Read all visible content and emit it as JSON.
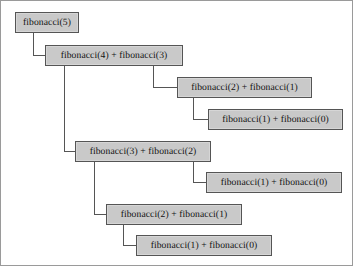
{
  "diagram": {
    "type": "recursion-tree",
    "canvas": {
      "width": 353,
      "height": 266,
      "background": "#ffffff",
      "border_color": "#9a9a9a"
    },
    "style": {
      "node_fill": "#c9c9c9",
      "node_border": "#555555",
      "node_text": "#121212",
      "connector_color": "#555555"
    },
    "nodes": [
      {
        "id": "n1",
        "label": "fibonacci(5)",
        "x": 14,
        "y": 11,
        "w": 64,
        "h": 21,
        "depth": 0
      },
      {
        "id": "n2",
        "label": "fibonacci(4) + fibonacci(3)",
        "x": 44,
        "y": 44,
        "w": 138,
        "h": 21,
        "depth": 1
      },
      {
        "id": "n3",
        "label": "fibonacci(2) + fibonacci(1)",
        "x": 176,
        "y": 76,
        "w": 135,
        "h": 21,
        "depth": 2
      },
      {
        "id": "n4",
        "label": "fibonacci(1) + fibonacci(0)",
        "x": 207,
        "y": 108,
        "w": 135,
        "h": 21,
        "depth": 3
      },
      {
        "id": "n5",
        "label": "fibonacci(3) + fibonacci(2)",
        "x": 74,
        "y": 140,
        "w": 136,
        "h": 21,
        "depth": 2
      },
      {
        "id": "n6",
        "label": "fibonacci(1) + fibonacci(0)",
        "x": 205,
        "y": 171,
        "w": 136,
        "h": 21,
        "depth": 3
      },
      {
        "id": "n7",
        "label": "fibonacci(2) + fibonacci(1)",
        "x": 105,
        "y": 203,
        "w": 136,
        "h": 21,
        "depth": 3
      },
      {
        "id": "n8",
        "label": "fibonacci(1) + fibonacci(0)",
        "x": 135,
        "y": 234,
        "w": 136,
        "h": 21,
        "depth": 4
      }
    ],
    "connectors": [
      {
        "id": "c1",
        "from": "n1",
        "to": "n2",
        "path": "M 32 32 L 32 54 L 44 54"
      },
      {
        "id": "c2",
        "from": "n2",
        "to": "n3",
        "path": "M 152 65 L 152 86 L 176 86"
      },
      {
        "id": "c3",
        "from": "n3",
        "to": "n4",
        "path": "M 192 97 L 192 118 L 207 118"
      },
      {
        "id": "c4",
        "from": "n2",
        "to": "n5",
        "path": "M 63 65 L 63 150 L 74 150"
      },
      {
        "id": "c5",
        "from": "n5",
        "to": "n6",
        "path": "M 192 161 L 192 181 L 205 181"
      },
      {
        "id": "c6",
        "from": "n5",
        "to": "n7",
        "path": "M 93 161 L 93 213 L 105 213"
      },
      {
        "id": "c7",
        "from": "n7",
        "to": "n8",
        "path": "M 122 224 L 122 244 L 135 244"
      }
    ]
  }
}
